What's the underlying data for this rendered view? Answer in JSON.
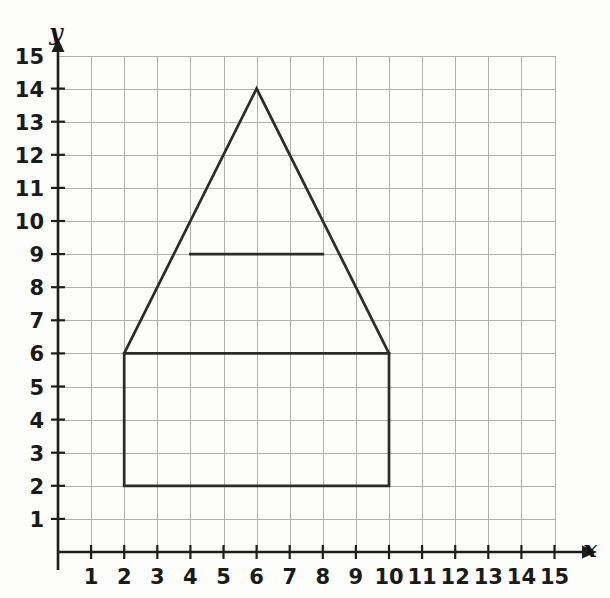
{
  "page": {
    "background_color": "#fdfdfc"
  },
  "colors": {
    "grid": "#b0b0b0",
    "grid_faint": "#c9c9c9",
    "axis": "#1d1d1d",
    "figure_stroke": "#2b2b2b",
    "label_text": "#1a1a1a"
  },
  "axes": {
    "x_axis_label": "x",
    "y_axis_label": "y",
    "x_ticks": [
      1,
      2,
      3,
      4,
      5,
      6,
      7,
      8,
      9,
      10,
      11,
      12,
      13,
      14,
      15
    ],
    "y_ticks": [
      1,
      2,
      3,
      4,
      5,
      6,
      7,
      8,
      9,
      10,
      11,
      12,
      13,
      14,
      15
    ],
    "x_tick_labels": [
      "1",
      "2",
      "3",
      "4",
      "5",
      "6",
      "7",
      "8",
      "9",
      "10",
      "11",
      "12",
      "13",
      "14",
      "15"
    ],
    "y_tick_labels": [
      "1",
      "2",
      "3",
      "4",
      "5",
      "6",
      "7",
      "8",
      "9",
      "10",
      "11",
      "12",
      "13",
      "14",
      "15"
    ]
  },
  "chart_data": {
    "type": "scatter",
    "title": "",
    "xlabel": "x",
    "ylabel": "y",
    "xlim": [
      0,
      15
    ],
    "ylim": [
      0,
      15
    ],
    "grid": true,
    "legend": "none",
    "x": [
      2,
      10,
      10,
      6,
      2,
      4,
      8
    ],
    "y": [
      2,
      2,
      6,
      14,
      6,
      9,
      9
    ],
    "annotations": [],
    "shapes": [
      {
        "name": "rectangle-base",
        "type": "polygon",
        "closed": true,
        "points": [
          [
            2,
            2
          ],
          [
            10,
            2
          ],
          [
            10,
            6
          ],
          [
            2,
            6
          ]
        ]
      },
      {
        "name": "triangle-roof",
        "type": "polyline",
        "closed": false,
        "points": [
          [
            2,
            6
          ],
          [
            6,
            14
          ],
          [
            10,
            6
          ]
        ]
      },
      {
        "name": "crossbar-segment",
        "type": "polyline",
        "closed": false,
        "points": [
          [
            4,
            9
          ],
          [
            8,
            9
          ]
        ]
      }
    ]
  },
  "geometry": {
    "origin_px": [
      58,
      552
    ],
    "unit_px": 33.1,
    "grid_extent_units": [
      15,
      15
    ]
  }
}
